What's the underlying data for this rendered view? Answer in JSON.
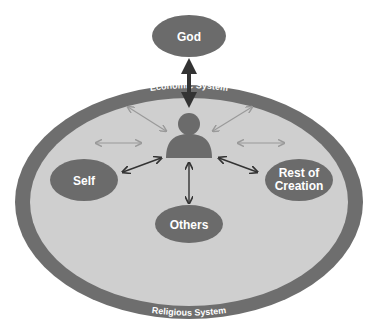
{
  "diagram": {
    "colors": {
      "node_fill": "#6b6b6b",
      "outer_ring": "#6e6e6e",
      "inner_field": "#cfcfcf",
      "dark_arrow": "#333333",
      "light_arrow": "#9a9a9a",
      "text": "#ffffff"
    },
    "top_node": {
      "label": "God"
    },
    "center": {
      "icon": "person-icon"
    },
    "nodes": {
      "self": {
        "label": "Self"
      },
      "others": {
        "label": "Others"
      },
      "rest_of_creation": {
        "line1": "Rest of",
        "line2": "Creation"
      }
    },
    "ring_labels": {
      "top": "Economic System",
      "left": "Political System",
      "right": "Social System",
      "bottom": "Religious System"
    }
  }
}
